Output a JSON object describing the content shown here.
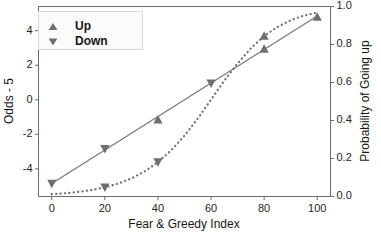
{
  "chart_data": {
    "type": "scatter",
    "title": "",
    "xlabel": "Fear & Greedy Index",
    "ylabel": "Odds - 5",
    "y2label": "Probability of Going up",
    "xlim": [
      -5,
      105
    ],
    "ylim": [
      -5.6,
      5.4
    ],
    "y2lim": [
      0.0,
      1.0
    ],
    "grid": false,
    "legend_position": "upper left",
    "xticks": [
      "0",
      "20",
      "40",
      "60",
      "80",
      "100"
    ],
    "xtick_values": [
      0,
      20,
      40,
      60,
      80,
      100
    ],
    "yticks": [
      "4",
      "2",
      "0",
      "-2",
      "-4"
    ],
    "ytick_values": [
      4,
      2,
      0,
      -2,
      -4
    ],
    "y2ticks": [
      "1.0",
      "0.8",
      "0.6",
      "0.4",
      "0.2",
      "0.0"
    ],
    "y2tick_values": [
      1.0,
      0.8,
      0.6,
      0.4,
      0.2,
      0.0
    ],
    "legend": [
      {
        "label": "Up",
        "marker": "triangle-up"
      },
      {
        "label": "Down",
        "marker": "triangle-down"
      }
    ],
    "series": [
      {
        "name": "Odds - 5 (linear fit)",
        "style": "solid-line",
        "axis": "left",
        "line_points": [
          [
            0,
            -4.85
          ],
          [
            100,
            4.85
          ]
        ]
      },
      {
        "name": "Probability of Going up (logistic fit)",
        "style": "dotted-curve",
        "axis": "right",
        "curve_points": [
          [
            0,
            0.012
          ],
          [
            5,
            0.017
          ],
          [
            10,
            0.024
          ],
          [
            15,
            0.034
          ],
          [
            20,
            0.048
          ],
          [
            25,
            0.068
          ],
          [
            30,
            0.095
          ],
          [
            35,
            0.132
          ],
          [
            40,
            0.181
          ],
          [
            45,
            0.243
          ],
          [
            50,
            0.32
          ],
          [
            55,
            0.41
          ],
          [
            60,
            0.51
          ],
          [
            65,
            0.61
          ],
          [
            70,
            0.7
          ],
          [
            75,
            0.78
          ],
          [
            80,
            0.845
          ],
          [
            85,
            0.892
          ],
          [
            90,
            0.928
          ],
          [
            95,
            0.952
          ],
          [
            100,
            0.968
          ]
        ]
      }
    ],
    "points": [
      {
        "x": 0,
        "odds": -4.85,
        "prob": 0.012,
        "group": "Down",
        "on": "line"
      },
      {
        "x": 20,
        "odds": -2.85,
        "prob": 0.222,
        "group": "Down",
        "on": "line"
      },
      {
        "x": 20,
        "odds": -4.35,
        "prob": 0.048,
        "group": "Down",
        "on": "curve"
      },
      {
        "x": 40,
        "odds": -1.15,
        "prob": 0.39,
        "group": "Up",
        "on": "line"
      },
      {
        "x": 40,
        "odds": -2.45,
        "prob": 0.181,
        "group": "Down",
        "on": "curve"
      },
      {
        "x": 60,
        "odds": 0.95,
        "prob": 0.6,
        "group": "Down",
        "on": "line"
      },
      {
        "x": 80,
        "odds": 2.95,
        "prob": 0.79,
        "group": "Up",
        "on": "line"
      },
      {
        "x": 80,
        "odds": 3.8,
        "prob": 0.845,
        "group": "Up",
        "on": "curve"
      },
      {
        "x": 100,
        "odds": 4.8,
        "prob": 0.968,
        "group": "Up",
        "on": "line"
      }
    ],
    "colors": {
      "marker": "#6e6e74",
      "line": "#7a7a7a",
      "curve": "#6f6f6f",
      "axis": "#6b6b6b",
      "text": "#161616",
      "background": "#ffffff",
      "legend_background": "#fbfbfb"
    }
  }
}
